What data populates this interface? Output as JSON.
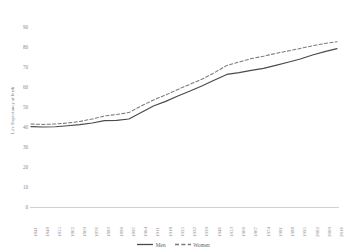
{
  "chart_data": {
    "type": "line",
    "title": "",
    "xlabel": "",
    "ylabel": "Life Expectancy at birth",
    "ylim": [
      0,
      90
    ],
    "ytick_step": 10,
    "yticks": [
      90,
      80,
      70,
      60,
      50,
      40,
      30,
      20,
      10,
      0
    ],
    "grid": false,
    "legend_position": "bottom-center",
    "categories": [
      "1841",
      "1848",
      "1855",
      "1862",
      "1869",
      "1876",
      "1883",
      "1890",
      "1897",
      "1904",
      "1911",
      "1918",
      "1925",
      "1932",
      "1939",
      "1946",
      "1953",
      "1960",
      "1967",
      "1974",
      "1981",
      "1988",
      "1995",
      "2002",
      "2009",
      "2016"
    ],
    "series": [
      {
        "name": "Men",
        "style": "solid",
        "color": "#4a4a4a",
        "values": [
          40.2,
          40.0,
          40.1,
          40.6,
          41.2,
          42.0,
          43.2,
          43.3,
          44.0,
          47.3,
          50.5,
          52.8,
          55.5,
          58.0,
          60.6,
          63.5,
          66.3,
          67.2,
          68.3,
          69.3,
          70.8,
          72.4,
          74.0,
          76.0,
          77.7,
          79.2
        ]
      },
      {
        "name": "Women",
        "style": "dashed",
        "color": "#7a7a7a",
        "values": [
          41.5,
          41.3,
          41.5,
          42.0,
          42.8,
          44.0,
          45.5,
          46.3,
          47.2,
          50.5,
          53.5,
          56.0,
          58.8,
          61.4,
          64.0,
          67.2,
          70.8,
          72.5,
          74.2,
          75.4,
          76.8,
          78.0,
          79.3,
          80.6,
          81.8,
          82.6
        ]
      }
    ]
  },
  "legend": {
    "items": [
      {
        "label": "Men"
      },
      {
        "label": "Women"
      }
    ]
  }
}
